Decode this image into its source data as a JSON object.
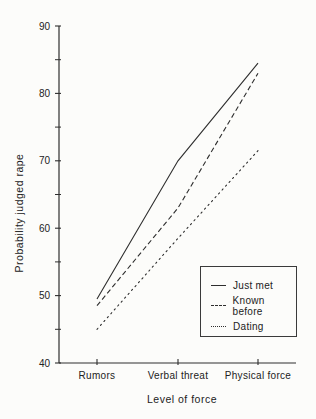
{
  "figure": {
    "background": "#fcfcfa",
    "ink": "#2e2e2e"
  },
  "chart_data": {
    "type": "line",
    "title": "",
    "xlabel": "Level of force",
    "ylabel": "Probability judged rape",
    "categories": [
      "Rumors",
      "Verbal threat",
      "Physical force"
    ],
    "series": [
      {
        "name": "Just met",
        "style": "solid",
        "values": [
          49.5,
          70,
          84.5
        ]
      },
      {
        "name": "Known before",
        "style": "dashed",
        "values": [
          48.5,
          63,
          83
        ]
      },
      {
        "name": "Dating",
        "style": "dotted",
        "values": [
          45,
          58.5,
          71.5
        ]
      }
    ],
    "ylim": [
      40,
      90
    ],
    "ytick_major": [
      40,
      50,
      60,
      70,
      80,
      90
    ],
    "ytick_minor": [
      45,
      55,
      65,
      75,
      85
    ],
    "grid": false,
    "legend_position": "lower-right"
  }
}
